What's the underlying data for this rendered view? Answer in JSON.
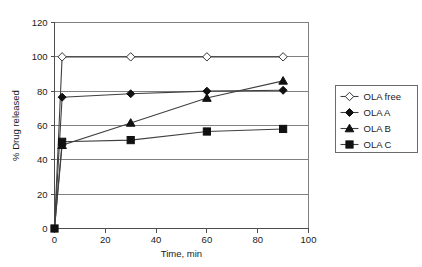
{
  "chart_data": {
    "type": "line",
    "title": "",
    "xlabel": "Time, min",
    "ylabel": "% Drug released",
    "xlim": [
      0,
      100
    ],
    "ylim": [
      0,
      120
    ],
    "xticks": [
      0,
      20,
      40,
      60,
      80,
      100
    ],
    "yticks": [
      0,
      20,
      40,
      60,
      80,
      100,
      120
    ],
    "grid": "horizontal",
    "legend_position": "right",
    "x": [
      0,
      3,
      30,
      60,
      90
    ],
    "series": [
      {
        "name": "OLA free",
        "marker": "diamond-open",
        "values": [
          0,
          100,
          100,
          100,
          100
        ]
      },
      {
        "name": "OLA A",
        "marker": "diamond-filled",
        "values": [
          0,
          76.5,
          78.5,
          80,
          80.5
        ]
      },
      {
        "name": "OLA B",
        "marker": "triangle-filled",
        "values": [
          0,
          48.5,
          61.5,
          76,
          86
        ]
      },
      {
        "name": "OLA C",
        "marker": "square-filled",
        "values": [
          0,
          50.5,
          51.5,
          56.5,
          58
        ]
      }
    ]
  },
  "axes": {
    "x_tick_labels": [
      "0",
      "20",
      "40",
      "60",
      "80",
      "100"
    ],
    "y_tick_labels": [
      "0",
      "20",
      "40",
      "60",
      "80",
      "100",
      "120"
    ],
    "x_axis_title": "Time, min",
    "y_axis_title": "% Drug released"
  },
  "legend": {
    "entries": [
      {
        "label": "OLA free",
        "marker": "diamond-open"
      },
      {
        "label": "OLA A",
        "marker": "diamond-filled"
      },
      {
        "label": "OLA B",
        "marker": "triangle-filled"
      },
      {
        "label": "OLA C",
        "marker": "square-filled"
      }
    ]
  },
  "colors": {
    "background": "#ffffff",
    "gridline": "#808080",
    "axis": "#4d4d4d",
    "series_line": "#404040",
    "marker_fill": "#111111",
    "marker_open_fill": "#ffffff",
    "text": "#1a1a1a"
  }
}
